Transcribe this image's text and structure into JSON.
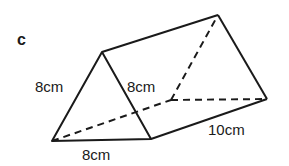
{
  "figure": {
    "label": "c",
    "shape": "triangular-prism",
    "dimensions": {
      "front_left_edge": "8cm",
      "front_right_edge": "8cm",
      "front_base": "8cm",
      "length": "10cm"
    },
    "colors": {
      "stroke": "#1a1a1a",
      "background": "#ffffff"
    }
  }
}
